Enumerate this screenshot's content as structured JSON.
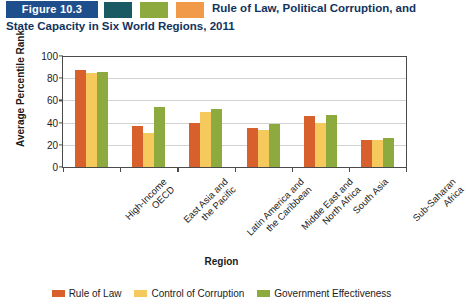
{
  "header": {
    "badge_label": "Figure 10.3",
    "title": "Rule of Law, Political Corruption, and State Capacity in Six World Regions, 2011",
    "badge_color": "#1F4E8C",
    "title_color": "#12335E",
    "swatches": [
      {
        "name": "teal-square",
        "color": "#1A5B63"
      },
      {
        "name": "green-square",
        "color": "#8CAA3E"
      },
      {
        "name": "orange-square",
        "color": "#F09A4A"
      }
    ]
  },
  "chart_data": {
    "type": "bar",
    "title": "Rule of Law, Political Corruption, and State Capacity in Six World Regions, 2011",
    "xlabel": "Region",
    "ylabel": "Average Percentile Rank",
    "ylim": [
      0,
      100
    ],
    "yticks": [
      0,
      20,
      40,
      60,
      80,
      100
    ],
    "grid": true,
    "legend_position": "bottom",
    "categories": [
      "High-Income OECD",
      "East Asia and the Pacific",
      "Latin America and the Caribbean",
      "Middle East and North Africa",
      "South Asia",
      "Sub-Saharan Africa"
    ],
    "category_lines": [
      [
        "High-Income",
        "OECD"
      ],
      [
        "East Asia and",
        "the Pacific"
      ],
      [
        "Latin America and",
        "the Caribbean"
      ],
      [
        "Middle East and",
        "North Africa"
      ],
      [
        "South Asia"
      ],
      [
        "Sub-Saharan",
        "Africa"
      ]
    ],
    "series": [
      {
        "name": "Rule of Law",
        "color": "#D8602D",
        "values": [
          87,
          37,
          40,
          35,
          46,
          24
        ]
      },
      {
        "name": "Control of Corruption",
        "color": "#F5C95C",
        "values": [
          85,
          31,
          50,
          33,
          40,
          24
        ]
      },
      {
        "name": "Government Effectiveness",
        "color": "#8CAA3E",
        "values": [
          86,
          54,
          52,
          39,
          47,
          26
        ]
      }
    ]
  }
}
